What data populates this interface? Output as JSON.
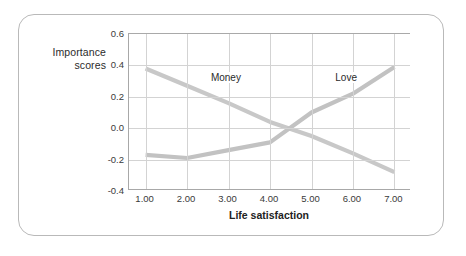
{
  "chart_data": {
    "type": "line",
    "title": "",
    "xlabel": "Life satisfaction",
    "ylabel": "Importance scores",
    "x": [
      1,
      2,
      3,
      4,
      5,
      6,
      7
    ],
    "xtick_labels": [
      "1.00",
      "2.00",
      "3.00",
      "4.00",
      "5.00",
      "6.00",
      "7.00"
    ],
    "ytick_labels": [
      "0.6",
      "0.4",
      "0.2",
      "0.0",
      "-0.2",
      "-0.4"
    ],
    "yticks": [
      0.6,
      0.4,
      0.2,
      0.0,
      -0.2,
      -0.4
    ],
    "xlim": [
      0.6,
      7.4
    ],
    "ylim": [
      -0.4,
      0.6
    ],
    "grid": true,
    "legend_position": "inline-annotations",
    "series": [
      {
        "name": "Money",
        "color": "#c8c8c8",
        "values": [
          0.38,
          0.27,
          0.16,
          0.04,
          -0.05,
          -0.16,
          -0.28
        ],
        "label_x": 2.55,
        "label_y": 0.31
      },
      {
        "name": "Love",
        "color": "#c2c2c2",
        "values": [
          -0.17,
          -0.19,
          -0.14,
          -0.09,
          0.1,
          0.22,
          0.39
        ],
        "label_x": 5.55,
        "label_y": 0.31
      }
    ]
  },
  "axes": {
    "y_title_line1": "Importance",
    "y_title_line2": "scores"
  }
}
